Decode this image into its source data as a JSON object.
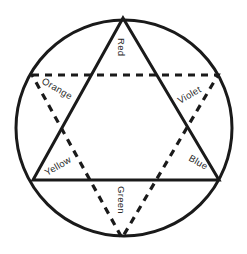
{
  "diagram": {
    "colors": {
      "stroke": "#1a1a1a",
      "text": "#2a2a2a",
      "background": "#ffffff"
    },
    "labels": {
      "red": "Red",
      "orange": "Orange",
      "violet": "Violet",
      "yellow": "Yellow",
      "blue": "Blue",
      "green": "Green"
    },
    "shapes": {
      "circle": "outer-circle",
      "solid_triangle": "primary-colors-triangle",
      "dashed_triangle": "secondary-colors-triangle"
    }
  }
}
